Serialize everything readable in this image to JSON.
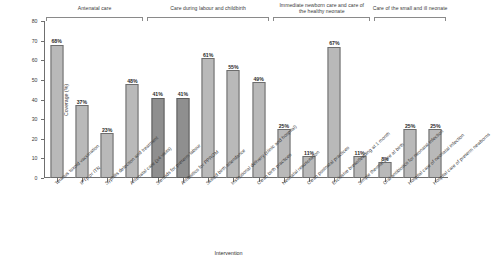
{
  "chart_data": {
    "type": "bar",
    "title": "",
    "xlabel": "Intervention",
    "ylabel": "Coverage (%)",
    "ylim": [
      0,
      80
    ],
    "yticks": [
      0,
      10,
      20,
      30,
      40,
      50,
      60,
      70,
      80
    ],
    "grid": false,
    "legend": "none",
    "categories": [
      "Tetanus toxoid vaccination",
      "IPTp or ITN",
      "Syphilis detection and treatment",
      "Antenatal care (≥4 visits)",
      "Steroids for preterm labour",
      "Antibiotics for PPROM",
      "Skilled birth attendance",
      "Institutional delivery (clinic and hospital)",
      "Clean birth practices",
      "Neonatal resuscitation",
      "Clean postnatal practices",
      "Exclusive breastfeeding at 1 month",
      "Simple thermal care at birth",
      "Oral antibiotics for neonatal infection",
      "Hospital care of neonatal infection",
      "Hospital care of preterm newborns"
    ],
    "values": [
      68,
      37,
      23,
      48,
      41,
      41,
      61,
      55,
      49,
      25,
      11,
      67,
      11,
      8,
      25,
      25
    ],
    "value_labels": [
      "68%",
      "37%",
      "23%",
      "48%",
      "41%",
      "41%",
      "61%",
      "55%",
      "49%",
      "25%",
      "11%",
      "67%",
      "11%",
      "8%",
      "25%",
      "25%"
    ],
    "bar_shades": [
      "light",
      "light",
      "light",
      "light",
      "dark",
      "dark",
      "light",
      "light",
      "light",
      "light",
      "light",
      "light",
      "light",
      "light",
      "light",
      "light"
    ],
    "colors": {
      "bar_light": "#b9b9b9",
      "bar_dark": "#8f8f8f",
      "bar_outline": "#6d6d6d",
      "axis": "#6f6f6f",
      "text": "#2b2b2b",
      "background": "#ffffff"
    },
    "groups": [
      {
        "label": "Antenatal care",
        "start": 0,
        "end": 3
      },
      {
        "label": "Care during labour and childbirth",
        "start": 4,
        "end": 8
      },
      {
        "label": "Immediate newborn care and care of the healthy neonate",
        "start": 9,
        "end": 12
      },
      {
        "label": "Care of the small and ill neonate",
        "start": 13,
        "end": 15
      }
    ]
  }
}
